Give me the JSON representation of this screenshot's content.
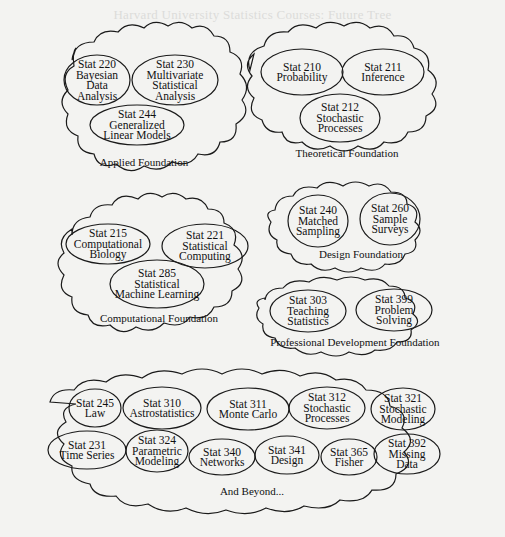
{
  "header": {
    "faded_title": "Harvard University Statistics Courses: Future Tree"
  },
  "colors": {
    "background": "#f3f3f1",
    "stroke": "#1a1a1a",
    "text": "#111111"
  },
  "foundations": [
    {
      "id": "applied",
      "label": "Applied Foundation",
      "courses": [
        {
          "lines": [
            "Stat 220",
            "Bayesian",
            "Data",
            "Analysis"
          ]
        },
        {
          "lines": [
            "Stat 230",
            "Multivariate",
            "Statistical",
            "Analysis"
          ]
        },
        {
          "lines": [
            "Stat 244",
            "Generalized",
            "Linear Models"
          ]
        }
      ]
    },
    {
      "id": "theoretical",
      "label": "Theoretical Foundation",
      "courses": [
        {
          "lines": [
            "Stat 210",
            "Probability"
          ]
        },
        {
          "lines": [
            "Stat 211",
            "Inference"
          ]
        },
        {
          "lines": [
            "Stat 212",
            "Stochastic",
            "Processes"
          ]
        }
      ]
    },
    {
      "id": "computational",
      "label": "Computational Foundation",
      "courses": [
        {
          "lines": [
            "Stat 215",
            "Computational",
            "Biology"
          ]
        },
        {
          "lines": [
            "Stat 221",
            "Statistical",
            "Computing"
          ]
        },
        {
          "lines": [
            "Stat 285",
            "Statistical",
            "Machine Learning"
          ]
        }
      ]
    },
    {
      "id": "design",
      "label": "Design Foundation",
      "courses": [
        {
          "lines": [
            "Stat 240",
            "Matched",
            "Sampling"
          ]
        },
        {
          "lines": [
            "Stat 260",
            "Sample",
            "Surveys"
          ]
        }
      ]
    },
    {
      "id": "professional",
      "label": "Professional Development Foundation",
      "courses": [
        {
          "lines": [
            "Stat 303",
            "Teaching",
            "Statistics"
          ]
        },
        {
          "lines": [
            "Stat 399",
            "Problem",
            "Solving"
          ]
        }
      ]
    },
    {
      "id": "beyond",
      "label": "And Beyond...",
      "courses": [
        {
          "lines": [
            "Stat 245",
            "Law"
          ]
        },
        {
          "lines": [
            "Stat 310",
            "Astrostatistics"
          ]
        },
        {
          "lines": [
            "Stat 311",
            "Monte Carlo"
          ]
        },
        {
          "lines": [
            "Stat 312",
            "Stochastic",
            "Processes"
          ]
        },
        {
          "lines": [
            "Stat 321",
            "Stochastic",
            "Modeling"
          ]
        },
        {
          "lines": [
            "Stat 231",
            "Time Series"
          ]
        },
        {
          "lines": [
            "Stat 324",
            "Parametric",
            "Modeling"
          ]
        },
        {
          "lines": [
            "Stat 340",
            "Networks"
          ]
        },
        {
          "lines": [
            "Stat 341",
            "Design"
          ]
        },
        {
          "lines": [
            "Stat 365",
            "Fisher"
          ]
        },
        {
          "lines": [
            "Stat 392",
            "Missing",
            "Data"
          ]
        }
      ]
    }
  ]
}
